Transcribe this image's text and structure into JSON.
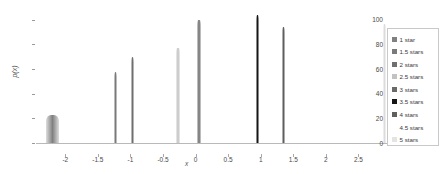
{
  "chart_data": {
    "type": "line",
    "title": "",
    "xlabel": "x",
    "ylabel": "p(x)",
    "xlim": [
      -2.45,
      3.0
    ],
    "ylim": [
      0,
      108
    ],
    "grid": false,
    "legend_position": "right",
    "x_ticks": [
      "-2",
      "-1.5",
      "-1",
      "-0.5",
      "0",
      "0.5",
      "1",
      "1.5",
      "2",
      "2.5"
    ],
    "x_tick_values": [
      -2,
      -1.5,
      -1,
      -0.5,
      0,
      0.5,
      1,
      1.5,
      2,
      2.5
    ],
    "y_ticks": [
      "0",
      "20",
      "40",
      "60",
      "80",
      "100"
    ],
    "y_tick_values": [
      0,
      20,
      40,
      60,
      80,
      100
    ],
    "series": [
      {
        "name": "1 star",
        "color": "#808080",
        "peak_x": -2.2,
        "peak_y": 23,
        "width": 0.075
      },
      {
        "name": "1.5 stars",
        "color": "#7a7a7a",
        "peak_x": -1.23,
        "peak_y": 58,
        "width": 0.02
      },
      {
        "name": "2 stars",
        "color": "#6f6f6f",
        "peak_x": -0.97,
        "peak_y": 70,
        "width": 0.02
      },
      {
        "name": "2.5 stars",
        "color": "#c2c2c2",
        "peak_x": -0.27,
        "peak_y": 77,
        "width": 0.018
      },
      {
        "name": "3 stars",
        "color": "#6a6a6a",
        "peak_x": 0.05,
        "peak_y": 100,
        "width": 0.02
      },
      {
        "name": "3.5 stars",
        "color": "#161616",
        "peak_x": 0.95,
        "peak_y": 104,
        "width": 0.018
      },
      {
        "name": "4 stars",
        "color": "#5f5f5f",
        "peak_x": 1.35,
        "peak_y": 94,
        "width": 0.018
      },
      {
        "name": "4.5 stars",
        "color": "#ffffff",
        "peak_x": null,
        "peak_y": 0,
        "width": 0
      },
      {
        "name": "5 stars",
        "color": "#dcdcdc",
        "peak_x": 2.9,
        "peak_y": 97,
        "width": 0.016
      }
    ]
  },
  "legend": {
    "entries": [
      {
        "label": "1 star",
        "swatch": "#808080",
        "has_swatch": true
      },
      {
        "label": "1.5 stars",
        "swatch": "#7a7a7a",
        "has_swatch": true
      },
      {
        "label": "2 stars",
        "swatch": "#6f6f6f",
        "has_swatch": true
      },
      {
        "label": "2.5 stars",
        "swatch": "#c2c2c2",
        "has_swatch": true
      },
      {
        "label": "3 stars",
        "swatch": "#6a6a6a",
        "has_swatch": true
      },
      {
        "label": "3.5 stars",
        "swatch": "#161616",
        "has_swatch": true
      },
      {
        "label": "4 stars",
        "swatch": "#5f5f5f",
        "has_swatch": true
      },
      {
        "label": "4.5 stars",
        "swatch": "#ffffff",
        "has_swatch": false
      },
      {
        "label": "5 stars",
        "swatch": "#e4e4e4",
        "has_swatch": true
      }
    ]
  }
}
